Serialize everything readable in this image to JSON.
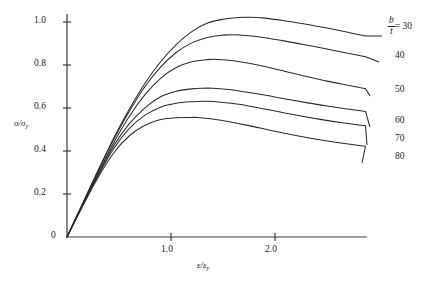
{
  "chart_data": {
    "type": "line",
    "title": "",
    "xlabel": "ε/ε_y",
    "ylabel": "σ/σ_y",
    "xlim": [
      0,
      2.87
    ],
    "ylim": [
      0,
      1.08
    ],
    "grid": false,
    "legend_position": "right-of-curve-ends",
    "x_ticks": [
      1.0,
      2.0
    ],
    "x_tick_labels": [
      "1.0",
      "2.0"
    ],
    "y_ticks": [
      0,
      0.2,
      0.4,
      0.6,
      0.8,
      1.0
    ],
    "y_tick_labels": [
      "0",
      "0.2",
      "0.4",
      "0.6",
      "0.8",
      "1.0"
    ],
    "series_parameter": "b/t",
    "series": [
      {
        "name": "30",
        "label": "b/t = 30",
        "peak_x": 1.75,
        "peak_y": 1.02,
        "x": [
          0,
          0.15,
          0.3,
          0.45,
          0.6,
          0.75,
          0.9,
          1.05,
          1.2,
          1.35,
          1.5,
          1.65,
          1.75,
          1.9,
          2.1,
          2.3,
          2.5,
          2.7,
          2.87
        ],
        "y": [
          0,
          0.155,
          0.31,
          0.46,
          0.595,
          0.715,
          0.815,
          0.895,
          0.955,
          0.995,
          1.013,
          1.021,
          1.022,
          1.018,
          1.005,
          0.99,
          0.972,
          0.952,
          0.935
        ]
      },
      {
        "name": "40",
        "label": "40",
        "peak_x": 1.6,
        "peak_y": 0.94,
        "x": [
          0,
          0.15,
          0.3,
          0.45,
          0.6,
          0.75,
          0.9,
          1.05,
          1.2,
          1.35,
          1.5,
          1.6,
          1.75,
          1.9,
          2.1,
          2.3,
          2.5,
          2.7,
          2.87
        ],
        "y": [
          0,
          0.155,
          0.31,
          0.455,
          0.585,
          0.7,
          0.79,
          0.858,
          0.903,
          0.928,
          0.939,
          0.941,
          0.936,
          0.927,
          0.911,
          0.893,
          0.874,
          0.855,
          0.838
        ]
      },
      {
        "name": "50",
        "label": "50",
        "peak_x": 1.45,
        "peak_y": 0.825,
        "x": [
          0,
          0.15,
          0.3,
          0.45,
          0.6,
          0.75,
          0.9,
          1.05,
          1.2,
          1.35,
          1.45,
          1.6,
          1.75,
          1.9,
          2.1,
          2.3,
          2.5,
          2.7,
          2.87
        ],
        "y": [
          0,
          0.152,
          0.3,
          0.44,
          0.562,
          0.662,
          0.738,
          0.788,
          0.815,
          0.825,
          0.826,
          0.82,
          0.808,
          0.793,
          0.77,
          0.747,
          0.725,
          0.706,
          0.69
        ]
      },
      {
        "name": "60",
        "label": "60",
        "peak_x": 1.4,
        "peak_y": 0.69,
        "x": [
          0,
          0.15,
          0.3,
          0.45,
          0.6,
          0.75,
          0.9,
          1.05,
          1.2,
          1.3,
          1.4,
          1.55,
          1.7,
          1.9,
          2.1,
          2.3,
          2.5,
          2.7,
          2.87
        ],
        "y": [
          0,
          0.148,
          0.292,
          0.425,
          0.527,
          0.601,
          0.652,
          0.678,
          0.689,
          0.692,
          0.692,
          0.686,
          0.676,
          0.66,
          0.642,
          0.625,
          0.609,
          0.595,
          0.584
        ]
      },
      {
        "name": "70",
        "label": "70",
        "peak_x": 1.35,
        "peak_y": 0.63,
        "x": [
          0,
          0.15,
          0.3,
          0.45,
          0.6,
          0.75,
          0.9,
          1.05,
          1.2,
          1.35,
          1.5,
          1.65,
          1.85,
          2.05,
          2.25,
          2.45,
          2.65,
          2.87
        ],
        "y": [
          0,
          0.146,
          0.287,
          0.412,
          0.505,
          0.567,
          0.604,
          0.622,
          0.629,
          0.631,
          0.626,
          0.617,
          0.6,
          0.581,
          0.563,
          0.546,
          0.531,
          0.517
        ]
      },
      {
        "name": "80",
        "label": "80",
        "peak_x": 1.25,
        "peak_y": 0.555,
        "x": [
          0,
          0.15,
          0.3,
          0.45,
          0.6,
          0.75,
          0.9,
          1.05,
          1.2,
          1.25,
          1.4,
          1.55,
          1.75,
          1.95,
          2.15,
          2.4,
          2.65,
          2.87
        ],
        "y": [
          0,
          0.143,
          0.278,
          0.392,
          0.471,
          0.52,
          0.546,
          0.555,
          0.556,
          0.556,
          0.549,
          0.537,
          0.518,
          0.497,
          0.477,
          0.455,
          0.436,
          0.422
        ]
      }
    ]
  },
  "axes": {
    "y_label_main": "σ",
    "y_label_slash": "/",
    "y_label_sub_base": "σ",
    "y_label_sub": "y",
    "x_label_main": "ε",
    "x_label_slash": "/",
    "x_label_sub_base": "ε",
    "x_label_sub": "y"
  },
  "series_key": {
    "numerator": "b",
    "denominator": "t",
    "equals": "= 30"
  },
  "colors": {
    "axis": "#3a3a3a",
    "curve": "#2a2a2a",
    "background": "#ffffff",
    "text": "#1a1a1a"
  }
}
